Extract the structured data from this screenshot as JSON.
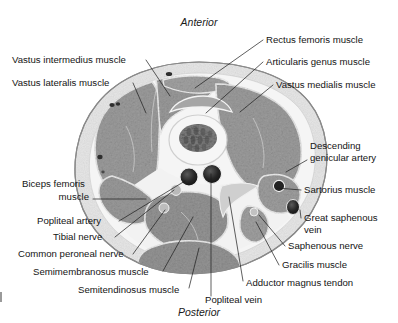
{
  "figure": {
    "type": "anatomical-cross-section",
    "region": "axial section through distal thigh at level of femur",
    "orientation": {
      "top_label": "Anterior",
      "bottom_label": "Posterior"
    },
    "colors": {
      "background": "#ffffff",
      "skin_outline": "#8d8d8d",
      "subcutaneous_fat": "#e9e9e9",
      "fascia": "#f4f4f4",
      "muscle": "#9a9a9a",
      "muscle_dark": "#8a8a8a",
      "bone_cortex": "#f2f2f2",
      "bone_marrow": "#6b6b6b",
      "vessel_dark": "#2a2a2a",
      "vessel_mid": "#4a4a4a",
      "nerve": "#b8b8b8",
      "leader_line": "#1a1a1a",
      "text": "#141414"
    },
    "annotations": [
      {
        "id": "vastus-intermedius-muscle",
        "label": "Vastus intermedius muscle",
        "side": "left",
        "text_x": 12,
        "text_y": 63,
        "anchor": "start",
        "leader": "M 146 60 L 170 96"
      },
      {
        "id": "vastus-lateralis-muscle",
        "label": "Vastus lateralis muscle",
        "side": "left",
        "text_x": 12,
        "text_y": 86,
        "anchor": "start",
        "leader": "M 133 83 L 146 113"
      },
      {
        "id": "rectus-femoris-muscle",
        "label": "Rectus femoris muscle",
        "side": "right",
        "text_x": 266,
        "text_y": 43,
        "anchor": "start",
        "leader": "M 263 40 L 195 88"
      },
      {
        "id": "articularis-genus-muscle",
        "label": "Articularis genus muscle",
        "side": "right",
        "text_x": 266,
        "text_y": 65,
        "anchor": "start",
        "leader": "M 263 62 L 206 113"
      },
      {
        "id": "vastus-medialis-muscle",
        "label": "Vastus medialis muscle",
        "side": "right",
        "text_x": 276,
        "text_y": 88,
        "anchor": "start",
        "leader": "M 273 85 L 240 112"
      },
      {
        "id": "descending-genicular-artery",
        "label": "Descending",
        "label2": "genicular artery",
        "side": "right",
        "text_x": 310,
        "text_y": 149,
        "anchor": "start",
        "leader": "M 307 160 L 286 170"
      },
      {
        "id": "sartorius-muscle",
        "label": "Sartorius muscle",
        "side": "right",
        "text_x": 304,
        "text_y": 193,
        "anchor": "start",
        "leader": "M 301 190 L 277 188"
      },
      {
        "id": "great-saphenous-vein",
        "label": "Great saphenous",
        "label2": "vein",
        "side": "right",
        "text_x": 304,
        "text_y": 221,
        "anchor": "start",
        "leader": "M 301 218 L 283 209"
      },
      {
        "id": "saphenous-nerve",
        "label": "Saphenous nerve",
        "side": "right",
        "text_x": 288,
        "text_y": 249,
        "anchor": "start",
        "leader": "M 285 246 L 259 214"
      },
      {
        "id": "gracilis-muscle",
        "label": "Gracilis muscle",
        "side": "right",
        "text_x": 282,
        "text_y": 268,
        "anchor": "start",
        "leader": "M 279 265 L 255 221"
      },
      {
        "id": "adductor-magnus-tendon",
        "label": "Adductor magnus tendon",
        "side": "right",
        "text_x": 246,
        "text_y": 286,
        "anchor": "start",
        "leader": "M 243 281 L 228 196"
      },
      {
        "id": "popliteal-vein",
        "label": "Popliteal vein",
        "side": "bottom",
        "text_x": 205,
        "text_y": 303,
        "anchor": "start",
        "leader": "M 211 295 L 211 173"
      },
      {
        "id": "biceps-femoris-muscle",
        "label": "Biceps femoris",
        "label2": "muscle",
        "side": "left",
        "text_x": 22,
        "text_y": 187,
        "anchor": "start",
        "leader": "M 93 199 L 145 199"
      },
      {
        "id": "popliteal-artery",
        "label": "Popliteal artery",
        "side": "left",
        "text_x": 37,
        "text_y": 224,
        "anchor": "start",
        "leader": "M 119 221 L 186 181"
      },
      {
        "id": "tibial-nerve",
        "label": "Tibial nerve",
        "side": "left",
        "text_x": 53,
        "text_y": 240,
        "anchor": "start",
        "leader": "M 115 237 L 175 188"
      },
      {
        "id": "common-peroneal-nerve",
        "label": "Common peroneal nerve",
        "side": "left",
        "text_x": 18,
        "text_y": 257,
        "anchor": "start",
        "leader": "M 133 254 L 168 206"
      },
      {
        "id": "semimembranosus-muscle",
        "label": "Semimembranosus muscle",
        "side": "left",
        "text_x": 33,
        "text_y": 275,
        "anchor": "start",
        "leader": "M 163 271 L 192 216"
      },
      {
        "id": "semitendinosus-muscle",
        "label": "Semitendinosus muscle",
        "side": "left",
        "text_x": 78,
        "text_y": 293,
        "anchor": "start",
        "leader": "M 189 288 L 198 243"
      }
    ]
  }
}
